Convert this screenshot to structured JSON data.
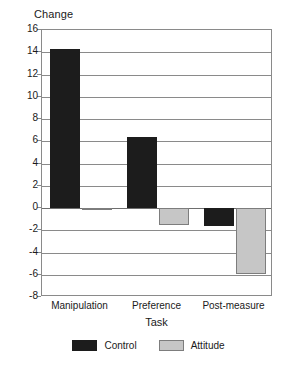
{
  "chart_data": {
    "type": "bar",
    "title": "",
    "xlabel": "Task",
    "ylabel": "Change",
    "categories": [
      "Manipulation",
      "Preference",
      "Post-measure"
    ],
    "series": [
      {
        "name": "Control",
        "color": "#1c1c1c",
        "values": [
          14.3,
          6.4,
          -1.6
        ]
      },
      {
        "name": "Attitude",
        "color": "#c6c6c6",
        "values": [
          -0.2,
          -1.5,
          -5.9
        ]
      }
    ],
    "ylim": [
      -8,
      16
    ],
    "ytick_values": [
      16,
      14,
      12,
      10,
      8,
      6,
      4,
      2,
      0,
      -2,
      -4,
      -6,
      -8
    ],
    "ytick_labels": [
      "16",
      "14",
      "12",
      "10",
      "8",
      "6",
      "4",
      "2",
      "0",
      "-2",
      "-4",
      "-6",
      "-8"
    ],
    "grid": true,
    "legend_position": "bottom",
    "zero_line": 0
  },
  "legend": {
    "items": [
      {
        "label": "Control"
      },
      {
        "label": "Attitude"
      }
    ]
  }
}
